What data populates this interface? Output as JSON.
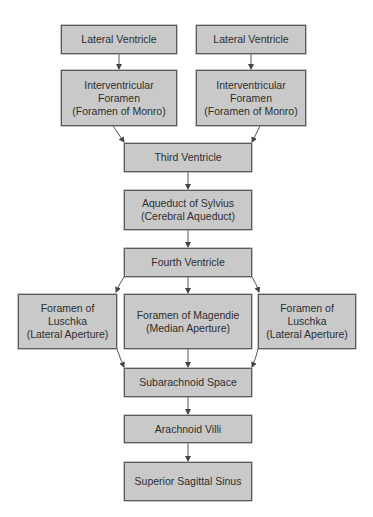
{
  "diagram": {
    "type": "flowchart",
    "colors": {
      "box_fill": "#c9c9c9",
      "box_border": "#5a5a5a",
      "text": "#2e2e2e",
      "arrow": "#444444"
    },
    "nodes": {
      "lateral_ventricle_left": "Lateral Ventricle",
      "lateral_ventricle_right": "Lateral Ventricle",
      "interventricular_left": "Interventricular\nForamen\n(Foramen of Monro)",
      "interventricular_right": "Interventricular\nForamen\n(Foramen of Monro)",
      "third_ventricle": "Third Ventricle",
      "aqueduct": "Aqueduct of Sylvius\n(Cerebral Aqueduct)",
      "fourth_ventricle": "Fourth Ventricle",
      "luschka_left": "Foramen of\nLuschka\n(Lateral Aperture)",
      "magendie": "Foramen of Magendie\n(Median Aperture)",
      "luschka_right": "Foramen of\nLuschka\n(Lateral Aperture)",
      "subarachnoid": "Subarachnoid Space",
      "arachnoid_villi": "Arachnoid Villi",
      "sagittal_sinus": "Superior Sagittal Sinus"
    },
    "edges": [
      [
        "lateral_ventricle_left",
        "interventricular_left"
      ],
      [
        "lateral_ventricle_right",
        "interventricular_right"
      ],
      [
        "interventricular_left",
        "third_ventricle"
      ],
      [
        "interventricular_right",
        "third_ventricle"
      ],
      [
        "third_ventricle",
        "aqueduct"
      ],
      [
        "aqueduct",
        "fourth_ventricle"
      ],
      [
        "fourth_ventricle",
        "luschka_left"
      ],
      [
        "fourth_ventricle",
        "magendie"
      ],
      [
        "fourth_ventricle",
        "luschka_right"
      ],
      [
        "luschka_left",
        "subarachnoid"
      ],
      [
        "magendie",
        "subarachnoid"
      ],
      [
        "luschka_right",
        "subarachnoid"
      ],
      [
        "subarachnoid",
        "arachnoid_villi"
      ],
      [
        "arachnoid_villi",
        "sagittal_sinus"
      ]
    ]
  }
}
